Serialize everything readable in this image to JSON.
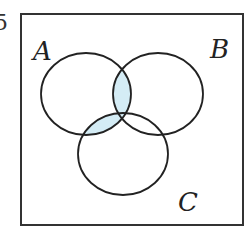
{
  "diagram": {
    "type": "venn",
    "edge_fragment": "5",
    "universal_set": {
      "frame": {
        "x": 21,
        "y": 14,
        "width": 222,
        "height": 211
      }
    },
    "sets": [
      {
        "name": "A",
        "label": "A",
        "cx": 86,
        "cy": 94,
        "rx": 45,
        "ry": 41,
        "label_x": 33,
        "label_y": 60
      },
      {
        "name": "B",
        "label": "B",
        "cx": 158,
        "cy": 94,
        "rx": 45,
        "ry": 41,
        "label_x": 212,
        "label_y": 58
      },
      {
        "name": "C",
        "label": "C",
        "cx": 123,
        "cy": 154,
        "rx": 45,
        "ry": 41,
        "label_x": 180,
        "label_y": 210
      }
    ],
    "shaded_region": "A ∩ (B ∪ C)",
    "colors": {
      "shade": "#d4ecf5",
      "stroke": "#222222",
      "frame": "#333333",
      "background": "#ffffff"
    }
  }
}
